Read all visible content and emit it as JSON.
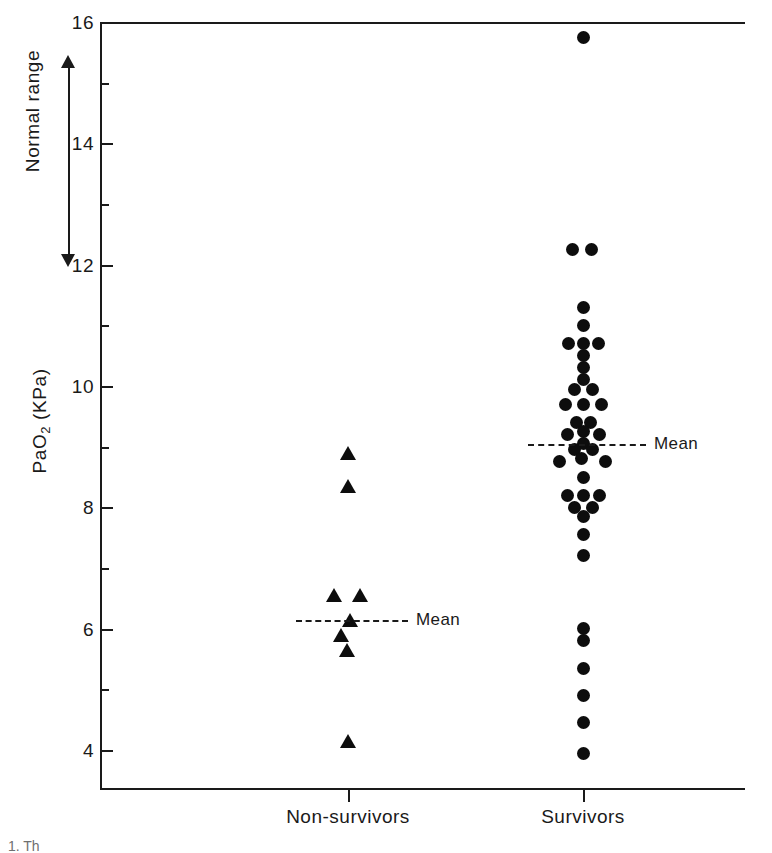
{
  "chart_data": {
    "type": "scatter",
    "title": "",
    "xlabel": "",
    "ylabel": "PaO2 (KPa)",
    "ylabel_base": "PaO",
    "ylabel_sub": "2",
    "ylabel_unit": " (KPa)",
    "ylim": [
      3.2,
      16.0
    ],
    "yticks_major": [
      4,
      6,
      8,
      10,
      12,
      14,
      16
    ],
    "yticks_minor": [
      5,
      7,
      9,
      11,
      13,
      15
    ],
    "ytick_labels": [
      "4",
      "6",
      "8",
      "10",
      "12",
      "14",
      "16"
    ],
    "grid": false,
    "legend": "none",
    "categories": [
      "Non-survivors",
      "Survivors"
    ],
    "annotations": [
      {
        "text": "Normal range",
        "from": 12.0,
        "to": 15.4,
        "style": "double-headed-arrow"
      },
      {
        "text": "Mean",
        "group": "Non-survivors",
        "value": 6.15
      },
      {
        "text": "Mean",
        "group": "Survivors",
        "value": 9.05
      }
    ],
    "series": [
      {
        "name": "Non-survivors",
        "marker": "triangle",
        "color": "#0d0d0d",
        "mean": 6.15,
        "n": 8,
        "points": [
          {
            "value": 8.9,
            "offset": 0
          },
          {
            "value": 8.35,
            "offset": 0
          },
          {
            "value": 6.55,
            "offset": -14
          },
          {
            "value": 6.55,
            "offset": 12
          },
          {
            "value": 6.15,
            "offset": 2
          },
          {
            "value": 5.9,
            "offset": -7
          },
          {
            "value": 5.65,
            "offset": -1
          },
          {
            "value": 4.15,
            "offset": 0
          }
        ]
      },
      {
        "name": "Survivors",
        "marker": "circle",
        "color": "#0d0d0d",
        "mean": 9.05,
        "n": 44,
        "points": [
          {
            "value": 15.75,
            "offset": 0
          },
          {
            "value": 12.25,
            "offset": -11
          },
          {
            "value": 12.25,
            "offset": 8
          },
          {
            "value": 11.3,
            "offset": 0
          },
          {
            "value": 11.0,
            "offset": 0
          },
          {
            "value": 10.7,
            "offset": -15
          },
          {
            "value": 10.7,
            "offset": 0
          },
          {
            "value": 10.7,
            "offset": 15
          },
          {
            "value": 10.5,
            "offset": 0
          },
          {
            "value": 10.3,
            "offset": 0
          },
          {
            "value": 10.1,
            "offset": 0
          },
          {
            "value": 9.95,
            "offset": -9
          },
          {
            "value": 9.95,
            "offset": 9
          },
          {
            "value": 9.7,
            "offset": -18
          },
          {
            "value": 9.7,
            "offset": 0
          },
          {
            "value": 9.7,
            "offset": 18
          },
          {
            "value": 9.4,
            "offset": -7
          },
          {
            "value": 9.4,
            "offset": 7
          },
          {
            "value": 9.25,
            "offset": 0
          },
          {
            "value": 9.2,
            "offset": -16
          },
          {
            "value": 9.2,
            "offset": 16
          },
          {
            "value": 9.05,
            "offset": 0
          },
          {
            "value": 8.95,
            "offset": -9
          },
          {
            "value": 8.95,
            "offset": 9
          },
          {
            "value": 8.8,
            "offset": -2
          },
          {
            "value": 8.75,
            "offset": -24
          },
          {
            "value": 8.75,
            "offset": 22
          },
          {
            "value": 8.5,
            "offset": 0
          },
          {
            "value": 8.2,
            "offset": -16
          },
          {
            "value": 8.2,
            "offset": 0
          },
          {
            "value": 8.2,
            "offset": 16
          },
          {
            "value": 8.0,
            "offset": -9
          },
          {
            "value": 8.0,
            "offset": 9
          },
          {
            "value": 7.85,
            "offset": 0
          },
          {
            "value": 7.55,
            "offset": 0
          },
          {
            "value": 7.2,
            "offset": 0
          },
          {
            "value": 6.0,
            "offset": 0
          },
          {
            "value": 5.8,
            "offset": 0
          },
          {
            "value": 5.35,
            "offset": 0
          },
          {
            "value": 4.9,
            "offset": 0
          },
          {
            "value": 4.45,
            "offset": 0
          },
          {
            "value": 3.95,
            "offset": 0
          }
        ]
      }
    ]
  },
  "axis": {
    "mean_label": "Mean",
    "normal_range_label": "Normal range"
  },
  "caption": {
    "text": "1.  Th"
  }
}
